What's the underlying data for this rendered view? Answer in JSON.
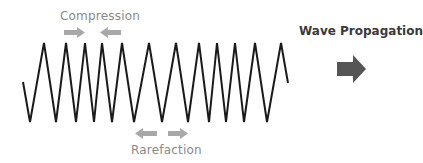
{
  "diagram": {
    "labels": {
      "compression": "Compression",
      "rarefaction": "Rarefaction",
      "propagation": "Wave Propagation"
    },
    "colors": {
      "wave": "#1a1a1a",
      "small_arrows": "#a8a8a8",
      "propagation_arrow": "#555555",
      "compression_text": "#8a8a8a",
      "propagation_text": "#3a3a3a"
    },
    "wave_points": "23,82 30,122 44,43 56,122 66,43 76,122 85,43 94,122 102,43 112,122 122,43 134,122 149,43 162,122 176,43 188,122 199,43 209,122 217,43 226,122 235,43 244,122 255,43 267,122 281,43 288,83",
    "icons": {
      "compression_left_arrow": "arrow-right",
      "compression_right_arrow": "arrow-left",
      "rarefaction_left_arrow": "arrow-left",
      "rarefaction_right_arrow": "arrow-right",
      "propagation_arrow": "arrow-right"
    }
  }
}
